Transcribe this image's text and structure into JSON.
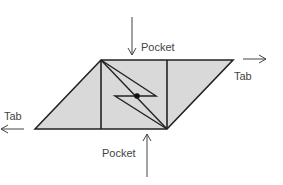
{
  "diagram": {
    "labels": {
      "pocket_top": "Pocket",
      "pocket_bottom": "Pocket",
      "tab_right": "Tab",
      "tab_left": "Tab"
    },
    "colors": {
      "fill": "#d9d9d9",
      "stroke": "#222222",
      "arrow": "#444444"
    }
  }
}
